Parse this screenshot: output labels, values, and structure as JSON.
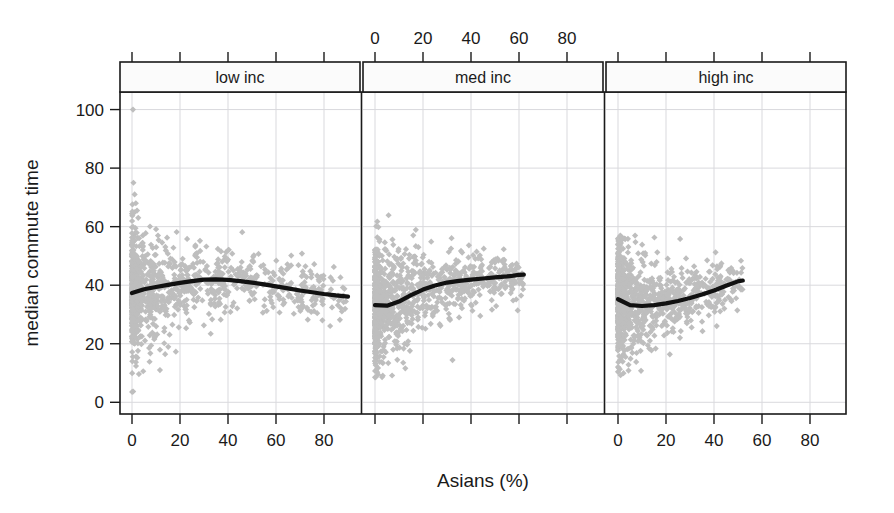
{
  "chart_data": {
    "type": "scatter",
    "title": "",
    "xlabel": "Asians (%)",
    "ylabel": "median commute time",
    "grid": true,
    "legend": false,
    "layout": "3 horizontal conditioning panels (lattice/trellis), shared y axis, alternating x axis labels (panels 1 and 3 on bottom, panel 2 on top)",
    "xlim": [
      -5,
      95
    ],
    "ylim": [
      -4,
      106
    ],
    "xticks": [
      0,
      20,
      40,
      60,
      80
    ],
    "yticks": [
      0,
      20,
      40,
      60,
      80,
      100
    ],
    "xtick_labels": [
      "0",
      "20",
      "40",
      "60",
      "80"
    ],
    "ytick_labels": [
      "0",
      "20",
      "40",
      "60",
      "80",
      "100"
    ],
    "marker": "diamond",
    "marker_color": "#bebebe",
    "smooth_color": "#111111",
    "panels": [
      {
        "label": "low inc",
        "axis_position": "bottom",
        "x_data_range": [
          0,
          90
        ],
        "y_data_range": [
          3,
          100
        ],
        "n_points": 1050,
        "smooth": {
          "x": [
            0,
            5,
            10,
            15,
            20,
            25,
            30,
            35,
            40,
            45,
            50,
            55,
            60,
            65,
            70,
            75,
            80,
            85,
            90
          ],
          "y": [
            37.3,
            38.6,
            39.4,
            40.1,
            40.8,
            41.4,
            41.9,
            42.0,
            41.8,
            41.4,
            40.9,
            40.3,
            39.6,
            38.9,
            38.2,
            37.6,
            37.0,
            36.5,
            36.1
          ]
        }
      },
      {
        "label": "med inc",
        "axis_position": "top",
        "x_data_range": [
          0,
          62
        ],
        "y_data_range": [
          8,
          66
        ],
        "n_points": 1050,
        "smooth": {
          "x": [
            0,
            5,
            10,
            15,
            20,
            25,
            30,
            35,
            40,
            45,
            50,
            55,
            60,
            62
          ],
          "y": [
            33.2,
            33.0,
            34.4,
            36.6,
            38.5,
            39.9,
            40.9,
            41.5,
            41.9,
            42.3,
            42.7,
            43.0,
            43.5,
            43.6
          ]
        }
      },
      {
        "label": "high inc",
        "axis_position": "bottom",
        "x_data_range": [
          0,
          52
        ],
        "y_data_range": [
          9,
          57
        ],
        "n_points": 1050,
        "smooth": {
          "x": [
            0,
            5,
            10,
            15,
            20,
            25,
            30,
            35,
            40,
            45,
            50,
            52
          ],
          "y": [
            35.2,
            33.2,
            32.9,
            33.2,
            33.8,
            34.6,
            35.6,
            36.8,
            38.2,
            39.8,
            41.3,
            41.6
          ]
        }
      }
    ]
  },
  "axes": {
    "y_title": "median commute time",
    "x_title": "Asians (%)"
  },
  "strips": {
    "panel1": "low inc",
    "panel2": "med inc",
    "panel3": "high inc"
  },
  "ticks": {
    "y": [
      "100",
      "80",
      "60",
      "40",
      "20",
      "0"
    ],
    "x": [
      "0",
      "20",
      "40",
      "60",
      "80"
    ]
  }
}
